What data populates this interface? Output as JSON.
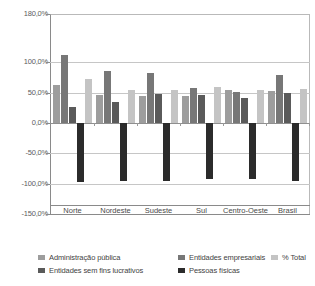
{
  "chart_data": {
    "type": "bar",
    "title": "",
    "subtitle": "",
    "xlabel": "",
    "ylabel": "",
    "grid": true,
    "legend_position": "bottom",
    "orientation": "vertical",
    "grouping": "grouped",
    "categories": [
      "Norte",
      "Nordeste",
      "Sudeste",
      "Sul",
      "Centro-Oeste",
      "Brasil"
    ],
    "ylim": [
      -150,
      180
    ],
    "yticks": [
      180,
      100,
      50,
      0,
      -50,
      -100,
      -150
    ],
    "ytick_labels": [
      "180,0%",
      "100,0%",
      "50,0%",
      "0,0%",
      "-50,0%",
      "-100,0%",
      "-150,0%"
    ],
    "series": [
      {
        "name": "Administração pública",
        "color": "#9d9d9d",
        "values": [
          63,
          47,
          44,
          45,
          55,
          53
        ]
      },
      {
        "name": "Entidades empresariais",
        "color": "#777777",
        "values": [
          113,
          86,
          83,
          58,
          51,
          80
        ]
      },
      {
        "name": "Entidades sem fins lucrativos",
        "color": "#5a5a5a",
        "values": [
          27,
          35,
          48,
          46,
          42,
          49
        ]
      },
      {
        "name": "Pessoas físicas",
        "color": "#2b2b2b",
        "values": [
          -97,
          -95,
          -95,
          -93,
          -93,
          -95
        ]
      },
      {
        "name": "% Total",
        "color": "#c4c4c4",
        "values": [
          73,
          55,
          54,
          60,
          54,
          56
        ]
      }
    ]
  },
  "legend": {
    "items": [
      {
        "label": "Administração pública",
        "color": "#9d9d9d"
      },
      {
        "label": "Entidades empresariais",
        "color": "#777777"
      },
      {
        "label": "% Total",
        "color": "#c4c4c4"
      },
      {
        "label": "Entidades sem fins lucrativos",
        "color": "#5a5a5a"
      },
      {
        "label": "Pessoas físicas",
        "color": "#2b2b2b"
      }
    ]
  },
  "colors": {
    "background": "#ffffff",
    "axis": "#8a8a8a",
    "gridline": "#c6c6c6",
    "text": "#4a4a4a"
  }
}
